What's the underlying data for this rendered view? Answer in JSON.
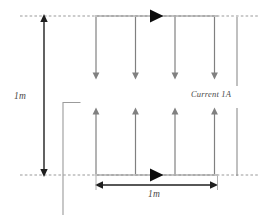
{
  "figure": {
    "type": "physics-diagram",
    "labels": {
      "height_dimension": "1m",
      "width_dimension": "1m",
      "current": "Current 1A"
    },
    "colors": {
      "wire": "#8c8c8c",
      "field_arrow": "#808080",
      "dimension": "#1a1a1a",
      "dashed_guide": "#9a9a9a",
      "marker": "#000000",
      "text": "#4a4a4a",
      "background": "#ffffff"
    },
    "geometry": {
      "top_wire_y": 16,
      "bottom_wire_y": 175,
      "wire_left_x": 96,
      "wire_right_x": 217,
      "separation_label": "1m",
      "length_label": "1m"
    },
    "field_arrows": {
      "upper_direction": "down",
      "lower_direction": "up",
      "upper_count": 4,
      "lower_count": 4,
      "x_positions": [
        96,
        135.5,
        175,
        214.5
      ]
    },
    "current_markers": {
      "direction": "right",
      "count": 2,
      "positions": [
        {
          "x": 155,
          "y": 16
        },
        {
          "x": 155,
          "y": 175
        }
      ]
    },
    "guides": {
      "dashed_lines": [
        {
          "y": 16,
          "x1": 20,
          "x2": 258
        },
        {
          "y": 175,
          "x1": 20,
          "x2": 258
        }
      ]
    }
  }
}
